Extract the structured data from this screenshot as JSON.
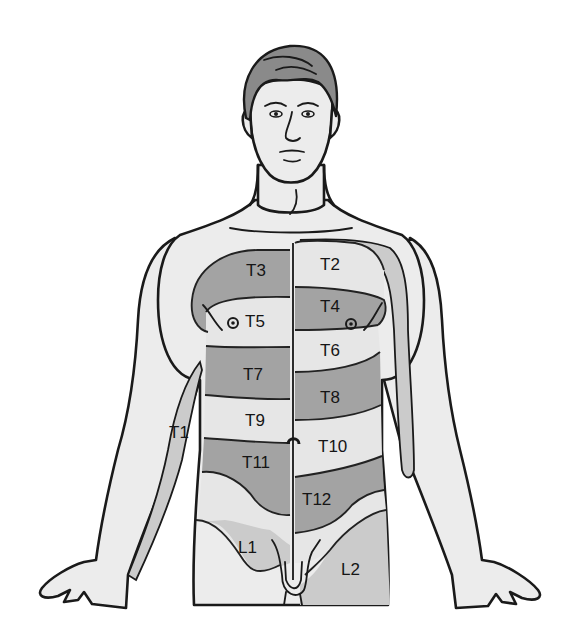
{
  "figure": {
    "colors": {
      "dark_band": "#a3a3a3",
      "mid_band": "#cbcbcb",
      "light_band": "#e6e6e6",
      "skin": "#ececec",
      "outline": "#1a1a1a"
    },
    "labels": {
      "T1": "T1",
      "T2": "T2",
      "T3": "T3",
      "T4": "T4",
      "T5": "T5",
      "T6": "T6",
      "T7": "T7",
      "T8": "T8",
      "T9": "T9",
      "T10": "T10",
      "T11": "T11",
      "T12": "T12",
      "L1": "L1",
      "L2": "L2"
    }
  }
}
